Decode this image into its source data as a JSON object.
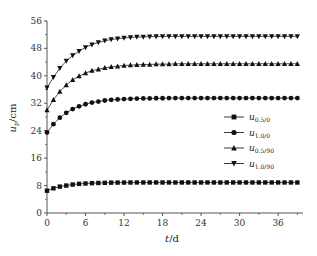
{
  "chart_data": {
    "type": "line",
    "title": "",
    "xlabel": "t/d",
    "ylabel": "u_p/cm",
    "xlim": [
      0,
      40
    ],
    "ylim": [
      0,
      56
    ],
    "xticks": [
      0,
      6,
      12,
      18,
      24,
      30,
      36
    ],
    "yticks": [
      0,
      8,
      16,
      24,
      32,
      40,
      48,
      56
    ],
    "grid": false,
    "legend_position": "right-middle",
    "x": [
      0,
      1,
      2,
      3,
      4,
      5,
      6,
      7,
      8,
      9,
      10,
      11,
      12,
      13,
      14,
      15,
      16,
      17,
      18,
      19,
      20,
      21,
      22,
      23,
      24,
      25,
      26,
      27,
      28,
      29,
      30,
      31,
      32,
      33,
      34,
      35,
      36,
      37,
      38,
      39
    ],
    "series": [
      {
        "name": "u0.5/0",
        "marker": "square",
        "values": [
          6.5,
          7.2,
          7.7,
          8.0,
          8.3,
          8.5,
          8.6,
          8.7,
          8.75,
          8.8,
          8.85,
          8.87,
          8.88,
          8.89,
          8.9,
          8.9,
          8.9,
          8.9,
          8.9,
          8.9,
          8.9,
          8.9,
          8.9,
          8.9,
          8.9,
          8.9,
          8.9,
          8.9,
          8.9,
          8.9,
          8.9,
          8.9,
          8.9,
          8.9,
          8.9,
          8.9,
          8.9,
          8.9,
          8.9,
          8.9
        ]
      },
      {
        "name": "u1.0/0",
        "marker": "circle",
        "values": [
          23.5,
          25.9,
          27.8,
          29.2,
          30.3,
          31.1,
          31.7,
          32.2,
          32.5,
          32.8,
          33.0,
          33.1,
          33.2,
          33.3,
          33.35,
          33.4,
          33.4,
          33.45,
          33.45,
          33.5,
          33.5,
          33.5,
          33.5,
          33.5,
          33.5,
          33.5,
          33.5,
          33.5,
          33.5,
          33.5,
          33.5,
          33.5,
          33.5,
          33.5,
          33.5,
          33.5,
          33.5,
          33.5,
          33.5,
          33.5
        ]
      },
      {
        "name": "u0.5/90",
        "marker": "triangle-up",
        "values": [
          30.0,
          33.0,
          35.4,
          37.3,
          38.8,
          39.9,
          40.8,
          41.5,
          41.9,
          42.3,
          42.6,
          42.8,
          43.0,
          43.1,
          43.2,
          43.3,
          43.3,
          43.4,
          43.4,
          43.4,
          43.5,
          43.5,
          43.5,
          43.5,
          43.5,
          43.5,
          43.5,
          43.5,
          43.5,
          43.5,
          43.5,
          43.5,
          43.5,
          43.5,
          43.5,
          43.5,
          43.5,
          43.5,
          43.5,
          43.5
        ]
      },
      {
        "name": "u1.0/90",
        "marker": "triangle-down",
        "values": [
          36.5,
          39.6,
          42.2,
          44.3,
          45.9,
          47.2,
          48.3,
          49.1,
          49.7,
          50.2,
          50.6,
          50.8,
          51.0,
          51.2,
          51.3,
          51.35,
          51.4,
          51.45,
          51.45,
          51.5,
          51.5,
          51.5,
          51.5,
          51.5,
          51.5,
          51.5,
          51.5,
          51.5,
          51.5,
          51.5,
          51.5,
          51.5,
          51.5,
          51.5,
          51.5,
          51.5,
          51.5,
          51.5,
          51.5,
          51.5
        ]
      }
    ]
  },
  "legend": [
    {
      "base": "u",
      "sub": "0.5/0"
    },
    {
      "base": "u",
      "sub": "1.0/0"
    },
    {
      "base": "u",
      "sub": "0.5/90"
    },
    {
      "base": "u",
      "sub": "1.0/90"
    }
  ],
  "axes": {
    "ylabel_base": "u",
    "ylabel_sub": "p",
    "ylabel_unit": "/cm",
    "xlabel_var": "t",
    "xlabel_unit": "/d"
  }
}
